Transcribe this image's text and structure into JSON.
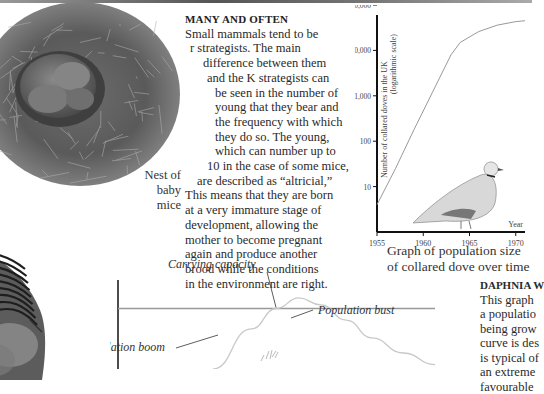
{
  "nest_caption": [
    "Nest of",
    "baby mice"
  ],
  "article": {
    "heading": "MANY AND OFTEN",
    "lines": [
      "Small mammals tend to be",
      "r strategists. The main",
      "difference between them",
      "and the K strategists can",
      "be seen in the number of",
      "young that they bear and",
      "the frequency with which",
      "they do so. The young,",
      "which can number up to",
      "10 in the case of some mice,",
      "are described as “altricial,”",
      "This means that they are born",
      "at a very immature stage of",
      "development, allowing the",
      "mother to become pregnant",
      "again and produce another",
      "brood while the conditions",
      "in the environment are right."
    ]
  },
  "dove_caption": "Graph of population size of collared dove over time",
  "daphnia": {
    "heading": "DAPHNIA W",
    "lines": [
      "This graph",
      "a populatio",
      "being grow",
      "curve is des",
      "is typical of",
      "an extreme",
      "favourable"
    ]
  },
  "chart_data": [
    {
      "type": "line",
      "title": "Graph of population size of collared dove over time",
      "xlabel": "Year",
      "ylabel": "Number of collared doves in the UK (logarithmic scale)",
      "yscale": "log",
      "xlim": [
        1955,
        1971
      ],
      "ylim": [
        1,
        100000
      ],
      "x_ticks": [
        1955,
        1960,
        1965,
        1970
      ],
      "y_ticks": [
        10,
        100,
        1000,
        10000,
        100000
      ],
      "y_tick_labels": [
        "10",
        "100",
        "1,000",
        "10,000",
        "100,000"
      ],
      "x_tick_labels": [
        "1955",
        "1960",
        "1965",
        "1970"
      ],
      "series": [
        {
          "name": "Collared doves",
          "x": [
            1955,
            1957,
            1959,
            1961,
            1963,
            1964,
            1966,
            1968,
            1970,
            1971
          ],
          "y": [
            4,
            25,
            180,
            1200,
            8000,
            15000,
            26000,
            36000,
            43000,
            45000
          ]
        }
      ]
    },
    {
      "type": "line",
      "title": "Daphnia population growth",
      "labels": {
        "carrying_capacity": "Carrying capacity",
        "population_bust": "Population bust",
        "population_boom": "Population boom"
      },
      "carrying_capacity_level": 0.68,
      "series": [
        {
          "name": "Population",
          "x": [
            0.3,
            0.42,
            0.5,
            0.57,
            0.64,
            0.72,
            0.8,
            0.9,
            1.0
          ],
          "y": [
            0.0,
            0.45,
            0.68,
            0.8,
            0.72,
            0.55,
            0.35,
            0.18,
            0.05
          ]
        }
      ]
    }
  ]
}
